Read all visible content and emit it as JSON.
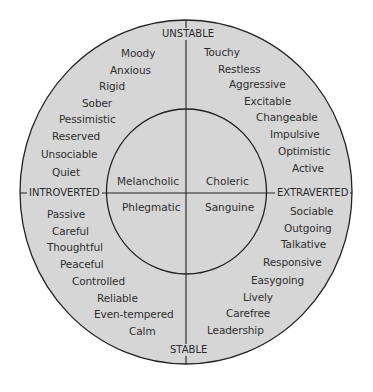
{
  "diagram": {
    "colors": {
      "fill": "#d6d6d6",
      "line": "#222222",
      "text": "#2e2e2e",
      "background": "#ffffff"
    },
    "axes": {
      "top": "UNSTABLE",
      "bottom": "STABLE",
      "left": "INTROVERTED",
      "right": "EXTRAVERTED"
    },
    "temperaments": {
      "upper_left": "Melancholic",
      "upper_right": "Choleric",
      "lower_left": "Phlegmatic",
      "lower_right": "Sanguine"
    },
    "traits": {
      "upper_left": [
        "Moody",
        "Anxious",
        "Rigid",
        "Sober",
        "Pessimistic",
        "Reserved",
        "Unsociable",
        "Quiet"
      ],
      "upper_right": [
        "Touchy",
        "Restless",
        "Aggressive",
        "Excitable",
        "Changeable",
        "Impulsive",
        "Optimistic",
        "Active"
      ],
      "lower_left": [
        "Passive",
        "Careful",
        "Thoughtful",
        "Peaceful",
        "Controlled",
        "Reliable",
        "Even-tempered",
        "Calm"
      ],
      "lower_right": [
        "Sociable",
        "Outgoing",
        "Talkative",
        "Responsive",
        "Easygoing",
        "Lively",
        "Carefree",
        "Leadership"
      ]
    }
  }
}
